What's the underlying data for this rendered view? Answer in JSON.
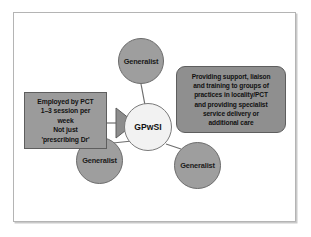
{
  "diagram": {
    "colors": {
      "frame_border": "#b4b4b4",
      "frame_background": "#ffffff",
      "generalist_fill": "#9e9e9e",
      "center_fill": "#f2f2f2",
      "left_box_fill": "#9b9b9b",
      "right_box_fill": "#8f8f8f",
      "connector_line": "#6e6e6e",
      "text": "#111111"
    },
    "center_node": {
      "label": "GPwSI",
      "shape": "circle"
    },
    "generalist_nodes": [
      {
        "label": "Generalist",
        "position": "top",
        "shape": "circle"
      },
      {
        "label": "Generalist",
        "position": "bottom-left",
        "shape": "circle"
      },
      {
        "label": "Generalist",
        "position": "bottom-right",
        "shape": "circle"
      }
    ],
    "left_box": {
      "text": "Employed by PCT\n1–3 session per\nweek\nNot just\n'prescribing Dr'",
      "shape": "rectangle"
    },
    "right_box": {
      "text": "Providing support, liaison\nand training to groups of\npractices in locality/PCT\nand providing specialist\nservice delivery or\nadditional care",
      "shape": "rounded-rectangle"
    },
    "arrow": {
      "name": "right-pointing-triangle",
      "direction": "right"
    },
    "connectors": [
      {
        "from": "generalist-top",
        "to": "center"
      },
      {
        "from": "generalist-bottom-left",
        "to": "center"
      },
      {
        "from": "generalist-bottom-right",
        "to": "center"
      },
      {
        "from": "left-box",
        "to": "arrow"
      }
    ]
  }
}
